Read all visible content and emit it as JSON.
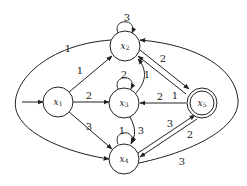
{
  "diagram": {
    "type": "weighted directed graph (automaton)",
    "nodes": [
      {
        "id": "x1",
        "label": "x",
        "sub": "1",
        "initial": true,
        "accepting": false
      },
      {
        "id": "x2",
        "label": "x",
        "sub": "2",
        "initial": false,
        "accepting": false
      },
      {
        "id": "x3",
        "label": "x",
        "sub": "3",
        "initial": false,
        "accepting": false
      },
      {
        "id": "x4",
        "label": "x",
        "sub": "4",
        "initial": false,
        "accepting": false
      },
      {
        "id": "x5",
        "label": "x",
        "sub": "5",
        "initial": false,
        "accepting": true
      }
    ],
    "edges": [
      {
        "from": "x1",
        "to": "x2",
        "label": "1"
      },
      {
        "from": "x1",
        "to": "x3",
        "label": "2"
      },
      {
        "from": "x1",
        "to": "x4",
        "label": "3"
      },
      {
        "from": "x2",
        "to": "x4",
        "label": "1"
      },
      {
        "from": "x2",
        "to": "x2",
        "label": "3"
      },
      {
        "from": "x3",
        "to": "x3",
        "label": "2"
      },
      {
        "from": "x4",
        "to": "x4",
        "label": "1"
      },
      {
        "from": "x3",
        "to": "x2",
        "label": "1"
      },
      {
        "from": "x2",
        "to": "x5",
        "label": "2"
      },
      {
        "from": "x5",
        "to": "x2",
        "label": "1"
      },
      {
        "from": "x5",
        "to": "x3",
        "label": "2"
      },
      {
        "from": "x3",
        "to": "x4",
        "label": "3"
      },
      {
        "from": "x4",
        "to": "x5",
        "label": "3"
      },
      {
        "from": "x5",
        "to": "x4",
        "label": "2"
      },
      {
        "from": "x4",
        "to": "x2",
        "label": "3"
      }
    ]
  }
}
